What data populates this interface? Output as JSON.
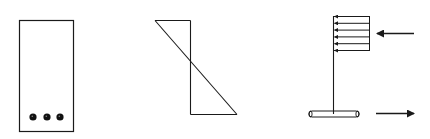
{
  "diagram": {
    "panels": [
      {
        "name": "cross-section",
        "rebar_count": 3
      },
      {
        "name": "strain-diagram"
      },
      {
        "name": "stress-block",
        "stress_arrow_count": 6,
        "forces": [
          "compression-left",
          "tension-right"
        ]
      }
    ],
    "colors": {
      "stroke": "#1a1a1a",
      "background": "#ffffff"
    }
  }
}
